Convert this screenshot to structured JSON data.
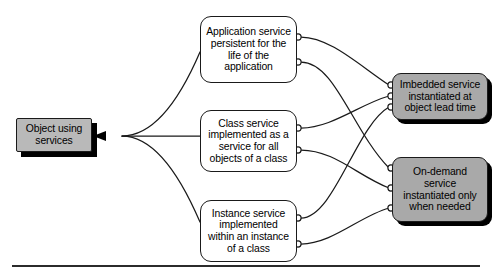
{
  "diagram": {
    "background_color": "#ffffff",
    "line_color": "#1a1a1a",
    "gray_fill_left": "#b9b9b9",
    "gray_fill_right": "#a9a9a9",
    "white_fill": "#ffffff",
    "rule_color": "#2b2b2b"
  },
  "source": {
    "label": "Object using\nservices",
    "kind": "gray-box"
  },
  "service_kinds": [
    {
      "id": "application-service",
      "label": "Application service\npersistent for the\nlife of the\napplication",
      "ports_out": 2
    },
    {
      "id": "class-service",
      "label": "Class service\nimplemented as a\nservice for all\nobjects of a class",
      "ports_out": 2
    },
    {
      "id": "instance-service",
      "label": "Instance service\nimplemented\nwithin an instance\nof a class",
      "ports_out": 2
    }
  ],
  "instantiation_kinds": [
    {
      "id": "imbedded-service",
      "label": "Imbedded service\ninstantiated at\nobject lead time",
      "ports_in": 3
    },
    {
      "id": "on-demand-service",
      "label": "On-demand\nservice\ninstantiated only\nwhen needed",
      "ports_in": 3
    }
  ],
  "arrow": {
    "direction": "left",
    "target": "object-using-services"
  }
}
